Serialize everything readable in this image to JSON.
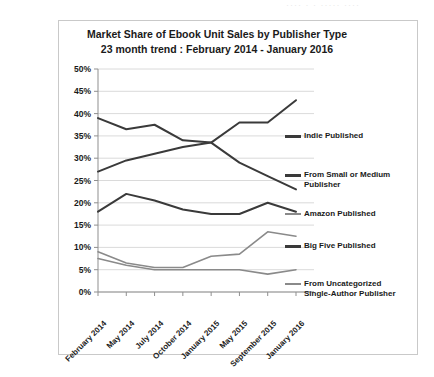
{
  "watermark": "····  ·  ·  ····· ····",
  "chart_data": {
    "type": "line",
    "title": "Market Share of Ebook Unit Sales by Publisher Type",
    "subtitle": "23 month trend : February 2014 - January 2016",
    "xlabel": "",
    "ylabel": "",
    "ylim": [
      0,
      50
    ],
    "yticks": [
      "0%",
      "5%",
      "10%",
      "15%",
      "20%",
      "25%",
      "30%",
      "35%",
      "40%",
      "45%",
      "50%"
    ],
    "ytick_values": [
      0,
      5,
      10,
      15,
      20,
      25,
      30,
      35,
      40,
      45,
      50
    ],
    "grid": true,
    "legend_position": "right",
    "categories": [
      "February 2014",
      "May 2014",
      "July 2014",
      "October 2014",
      "January 2015",
      "May 2015",
      "September 2015",
      "January 2016"
    ],
    "series": [
      {
        "name": "Indie Published",
        "color": "#3a3a3a",
        "width": 2.0,
        "values": [
          27.0,
          29.5,
          31.0,
          32.5,
          33.5,
          38.0,
          38.0,
          43.0
        ]
      },
      {
        "name": "From Small or Medium Publisher",
        "color": "#3a3a3a",
        "width": 2.0,
        "values": [
          39.0,
          36.5,
          37.5,
          34.0,
          33.5,
          29.0,
          26.0,
          23.0
        ]
      },
      {
        "name": "Amazon Published",
        "color": "#8a8a8a",
        "width": 1.6,
        "values": [
          9.0,
          6.5,
          5.5,
          5.5,
          8.0,
          8.5,
          13.5,
          12.5
        ]
      },
      {
        "name": "Big Five Published",
        "color": "#3a3a3a",
        "width": 2.0,
        "values": [
          18.0,
          22.0,
          20.5,
          18.5,
          17.5,
          17.5,
          20.0,
          18.0
        ]
      },
      {
        "name": "From Uncategorized Single-Author Publisher",
        "color": "#8a8a8a",
        "width": 1.6,
        "values": [
          7.5,
          6.0,
          5.0,
          5.0,
          5.0,
          5.0,
          4.0,
          5.0
        ]
      }
    ]
  },
  "legend": [
    {
      "label": "Indie Published"
    },
    {
      "label": "From Small or Medium Publisher"
    },
    {
      "label": "Amazon Published"
    },
    {
      "label": "Big Five Published"
    },
    {
      "label": "From Uncategorized Single-Author Publisher"
    }
  ]
}
